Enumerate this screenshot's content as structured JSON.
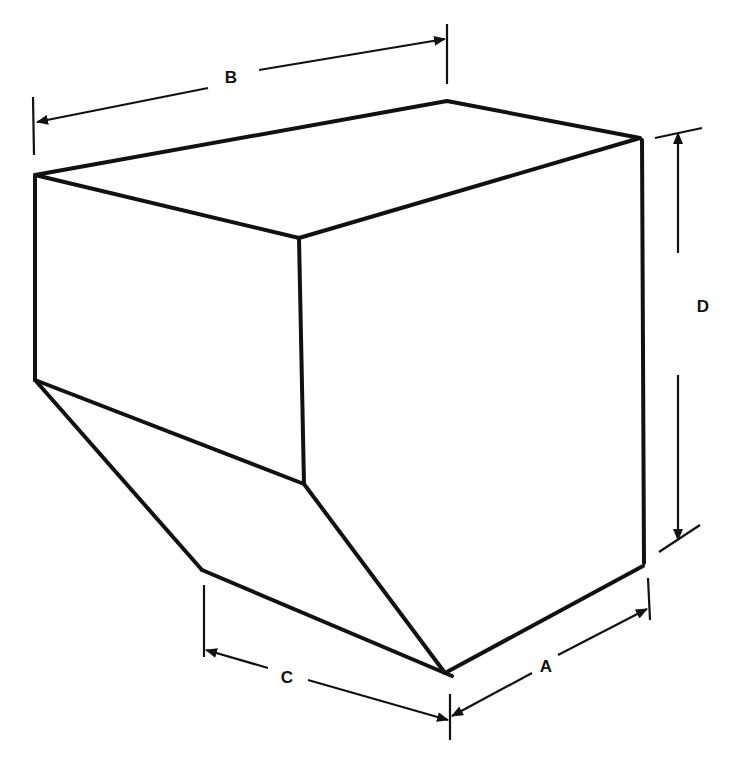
{
  "diagram": {
    "type": "isometric-dimension-drawing",
    "colors": {
      "background": "#ffffff",
      "stroke": "#111111"
    },
    "dimensions": [
      {
        "id": "A",
        "label": "A",
        "describes": "depth of bottom edge (front-right)"
      },
      {
        "id": "B",
        "label": "B",
        "describes": "overall width across top"
      },
      {
        "id": "C",
        "label": "C",
        "describes": "depth of hopper bottom edge"
      },
      {
        "id": "D",
        "label": "D",
        "describes": "overall height of right side"
      }
    ],
    "labels": {
      "A": "A",
      "B": "B",
      "C": "C",
      "D": "D"
    }
  }
}
